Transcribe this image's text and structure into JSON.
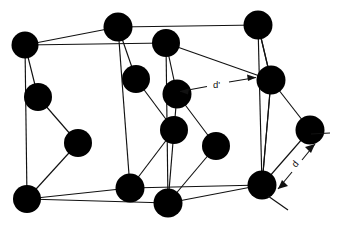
{
  "figure": {
    "background_color": "#ffffff",
    "atom_color": "#000000",
    "line_color": "#111111"
  },
  "annotations": [
    {
      "id": "d-prime",
      "label": "d'",
      "type": "double-headed-arrow",
      "orientation": "horizontal",
      "label_x": 218,
      "label_y": 84,
      "from_x": 178,
      "from_y": 92,
      "to_x": 258,
      "to_y": 77
    },
    {
      "id": "d",
      "label": "d",
      "type": "double-headed-arrow",
      "orientation": "diagonal",
      "label_x": 296,
      "label_y": 166,
      "rotation_deg": -58,
      "from_x": 277,
      "from_y": 190,
      "to_x": 316,
      "to_y": 143
    }
  ],
  "atoms": [
    {
      "id": "a1",
      "cx": 25,
      "cy": 45,
      "r": 13.5,
      "role": "corner-back-top-left"
    },
    {
      "id": "a2",
      "cx": 118,
      "cy": 27,
      "r": 14.5,
      "role": "corner-back-top-mid"
    },
    {
      "id": "a3",
      "cx": 258,
      "cy": 25,
      "r": 14.5,
      "role": "corner-back-top-right"
    },
    {
      "id": "a4",
      "cx": 166,
      "cy": 43,
      "r": 14.0,
      "role": "corner-front-top-mid"
    },
    {
      "id": "a5",
      "cx": 38,
      "cy": 97,
      "r": 14.0,
      "role": "corner-back-left-mid"
    },
    {
      "id": "a6",
      "cx": 136,
      "cy": 79,
      "r": 14.0,
      "role": "interior-upper-left"
    },
    {
      "id": "a7",
      "cx": 177,
      "cy": 94,
      "r": 14.5,
      "role": "interior-centre-upper"
    },
    {
      "id": "a8",
      "cx": 271,
      "cy": 80,
      "r": 14.5,
      "role": "corner-front-right-upper"
    },
    {
      "id": "a9",
      "cx": 78,
      "cy": 143,
      "r": 14.0,
      "role": "interior-left-lower"
    },
    {
      "id": "a10",
      "cx": 174,
      "cy": 130,
      "r": 14.0,
      "role": "interior-centre-lower"
    },
    {
      "id": "a11",
      "cx": 216,
      "cy": 146,
      "r": 14.0,
      "role": "interior-right-lower"
    },
    {
      "id": "a12",
      "cx": 310,
      "cy": 130,
      "r": 14.5,
      "role": "corner-far-right-mid"
    },
    {
      "id": "a13",
      "cx": 27,
      "cy": 199,
      "r": 14.0,
      "role": "corner-back-bottom-left"
    },
    {
      "id": "a14",
      "cx": 130,
      "cy": 188,
      "r": 14.5,
      "role": "corner-bottom-mid"
    },
    {
      "id": "a15",
      "cx": 168,
      "cy": 203,
      "r": 14.5,
      "role": "corner-front-bottom-mid"
    },
    {
      "id": "a16",
      "cx": 262,
      "cy": 185,
      "r": 14.5,
      "role": "corner-bottom-right"
    }
  ],
  "bonds": [
    {
      "from": "a1",
      "to": "a5"
    },
    {
      "from": "a5",
      "to": "a9"
    },
    {
      "from": "a9",
      "to": "a13"
    },
    {
      "from": "a2",
      "to": "a6"
    },
    {
      "from": "a6",
      "to": "a10"
    },
    {
      "from": "a4",
      "to": "a7"
    },
    {
      "from": "a7",
      "to": "a10"
    },
    {
      "from": "a10",
      "to": "a14"
    },
    {
      "from": "a10",
      "to": "a15"
    },
    {
      "from": "a7",
      "to": "a11"
    },
    {
      "from": "a11",
      "to": "a15"
    },
    {
      "from": "a3",
      "to": "a8"
    },
    {
      "from": "a8",
      "to": "a12"
    },
    {
      "from": "a12",
      "to": "a16"
    },
    {
      "from": "a8",
      "to": "a16"
    }
  ],
  "cell_edges": [
    {
      "x1": 25,
      "y1": 45,
      "x2": 118,
      "y2": 27
    },
    {
      "x1": 118,
      "y1": 27,
      "x2": 258,
      "y2": 25
    },
    {
      "x1": 25,
      "y1": 45,
      "x2": 27,
      "y2": 199
    },
    {
      "x1": 27,
      "y1": 199,
      "x2": 168,
      "y2": 203
    },
    {
      "x1": 168,
      "y1": 203,
      "x2": 262,
      "y2": 185
    },
    {
      "x1": 262,
      "y1": 185,
      "x2": 271,
      "y2": 80
    },
    {
      "x1": 271,
      "y1": 80,
      "x2": 258,
      "y2": 25
    },
    {
      "x1": 166,
      "y1": 43,
      "x2": 168,
      "y2": 203
    },
    {
      "x1": 25,
      "y1": 45,
      "x2": 166,
      "y2": 43
    },
    {
      "x1": 166,
      "y1": 43,
      "x2": 271,
      "y2": 80
    },
    {
      "x1": 118,
      "y1": 27,
      "x2": 130,
      "y2": 188
    },
    {
      "x1": 27,
      "y1": 199,
      "x2": 130,
      "y2": 188
    },
    {
      "x1": 130,
      "y1": 188,
      "x2": 262,
      "y2": 185
    },
    {
      "x1": 258,
      "y1": 25,
      "x2": 262,
      "y2": 185
    }
  ]
}
